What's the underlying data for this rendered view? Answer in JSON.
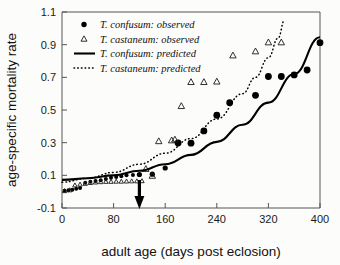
{
  "chart_data": {
    "type": "scatter",
    "title": "",
    "xlabel": "adult age (days post eclosion)",
    "ylabel": "age-specific mortality rate",
    "xlim": [
      0,
      400
    ],
    "ylim": [
      -0.1,
      1.1
    ],
    "xticks": [
      0,
      80,
      160,
      240,
      320,
      400
    ],
    "yticks": [
      -0.1,
      0.1,
      0.3,
      0.5,
      0.7,
      0.9,
      1.1
    ],
    "xticklabels": [
      "0",
      "80",
      "160",
      "240",
      "320",
      "400"
    ],
    "yticklabels": [
      "-0.1",
      "0.1",
      "0.3",
      "0.5",
      "0.7",
      "0.9",
      "1.1"
    ],
    "grid": false,
    "legend_position": "upper left",
    "annotations": [
      {
        "name": "down-arrow",
        "x": 120,
        "y": -0.1,
        "label": ""
      }
    ],
    "series": [
      {
        "name": "T. confusum: observed",
        "type": "scatter",
        "marker": "filled-circle",
        "color": "#000000",
        "points": [
          {
            "x": 4,
            "y": 0.005
          },
          {
            "x": 10,
            "y": 0.008
          },
          {
            "x": 16,
            "y": 0.012
          },
          {
            "x": 22,
            "y": 0.018
          },
          {
            "x": 28,
            "y": 0.022
          },
          {
            "x": 36,
            "y": 0.055
          },
          {
            "x": 44,
            "y": 0.06
          },
          {
            "x": 52,
            "y": 0.065
          },
          {
            "x": 60,
            "y": 0.07
          },
          {
            "x": 68,
            "y": 0.078
          },
          {
            "x": 76,
            "y": 0.085
          },
          {
            "x": 84,
            "y": 0.09
          },
          {
            "x": 92,
            "y": 0.095
          },
          {
            "x": 100,
            "y": 0.1
          },
          {
            "x": 110,
            "y": 0.102
          },
          {
            "x": 120,
            "y": 0.105
          },
          {
            "x": 140,
            "y": 0.107
          },
          {
            "x": 160,
            "y": 0.145
          },
          {
            "x": 180,
            "y": 0.298
          },
          {
            "x": 200,
            "y": 0.297
          },
          {
            "x": 220,
            "y": 0.372
          },
          {
            "x": 240,
            "y": 0.468
          },
          {
            "x": 260,
            "y": 0.545
          },
          {
            "x": 300,
            "y": 0.59
          },
          {
            "x": 320,
            "y": 0.705
          },
          {
            "x": 340,
            "y": 0.705
          },
          {
            "x": 360,
            "y": 0.715
          },
          {
            "x": 380,
            "y": 0.745
          },
          {
            "x": 400,
            "y": 0.912
          }
        ]
      },
      {
        "name": "T. castaneum: observed",
        "type": "scatter",
        "marker": "open-triangle",
        "color": "#1a1a1a",
        "points": [
          {
            "x": 4,
            "y": 0.005
          },
          {
            "x": 12,
            "y": 0.01
          },
          {
            "x": 20,
            "y": 0.04
          },
          {
            "x": 28,
            "y": 0.045
          },
          {
            "x": 36,
            "y": 0.05
          },
          {
            "x": 44,
            "y": 0.055
          },
          {
            "x": 52,
            "y": 0.058
          },
          {
            "x": 60,
            "y": 0.06
          },
          {
            "x": 68,
            "y": 0.062
          },
          {
            "x": 76,
            "y": 0.062
          },
          {
            "x": 84,
            "y": 0.063
          },
          {
            "x": 92,
            "y": 0.063
          },
          {
            "x": 100,
            "y": 0.064
          },
          {
            "x": 108,
            "y": 0.065
          },
          {
            "x": 116,
            "y": 0.065
          },
          {
            "x": 124,
            "y": 0.066
          },
          {
            "x": 130,
            "y": 0.14
          },
          {
            "x": 140,
            "y": 0.098
          },
          {
            "x": 150,
            "y": 0.31
          },
          {
            "x": 170,
            "y": 0.315
          },
          {
            "x": 175,
            "y": 0.32
          },
          {
            "x": 185,
            "y": 0.525
          },
          {
            "x": 200,
            "y": 0.672
          },
          {
            "x": 220,
            "y": 0.672
          },
          {
            "x": 240,
            "y": 0.675
          },
          {
            "x": 265,
            "y": 0.835
          },
          {
            "x": 300,
            "y": 0.86
          },
          {
            "x": 320,
            "y": 0.915
          },
          {
            "x": 340,
            "y": 0.915
          }
        ]
      },
      {
        "name": "T. confusum: predicted",
        "type": "line",
        "style": "solid",
        "color": "#000000",
        "points": [
          {
            "x": 0,
            "y": 0.072
          },
          {
            "x": 40,
            "y": 0.082
          },
          {
            "x": 80,
            "y": 0.1
          },
          {
            "x": 120,
            "y": 0.128
          },
          {
            "x": 160,
            "y": 0.168
          },
          {
            "x": 200,
            "y": 0.225
          },
          {
            "x": 240,
            "y": 0.305
          },
          {
            "x": 280,
            "y": 0.41
          },
          {
            "x": 320,
            "y": 0.545
          },
          {
            "x": 360,
            "y": 0.72
          },
          {
            "x": 400,
            "y": 0.945
          }
        ]
      },
      {
        "name": "T. castaneum: predicted",
        "type": "line",
        "style": "dotted",
        "color": "#000000",
        "points": [
          {
            "x": 0,
            "y": 0.058
          },
          {
            "x": 40,
            "y": 0.082
          },
          {
            "x": 80,
            "y": 0.118
          },
          {
            "x": 120,
            "y": 0.168
          },
          {
            "x": 160,
            "y": 0.235
          },
          {
            "x": 200,
            "y": 0.325
          },
          {
            "x": 240,
            "y": 0.445
          },
          {
            "x": 280,
            "y": 0.6
          },
          {
            "x": 300,
            "y": 0.7
          },
          {
            "x": 320,
            "y": 0.82
          },
          {
            "x": 335,
            "y": 0.94
          },
          {
            "x": 345,
            "y": 1.05
          }
        ]
      }
    ],
    "legend": [
      {
        "label": "T. confusum: observed",
        "marker": "filled-circle"
      },
      {
        "label": "T. castaneum: observed",
        "marker": "open-triangle"
      },
      {
        "label": "T. confusum: predicted",
        "marker": "solid-line"
      },
      {
        "label": "T. castaneum: predicted",
        "marker": "dotted-line"
      }
    ]
  }
}
